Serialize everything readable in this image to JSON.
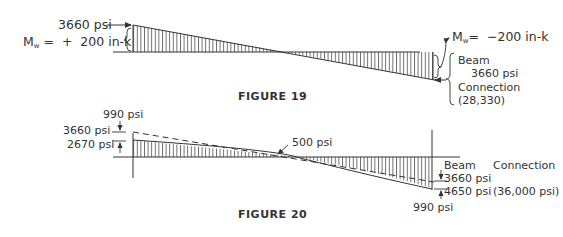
{
  "figure19": {
    "caption": "FIGURE 19",
    "left_stress": "3660 psi",
    "left_moment_symbol": "M",
    "left_moment_sub": "w",
    "left_moment_value": "=  +  200 in-k",
    "right_moment_symbol": "M",
    "right_moment_sub": "w",
    "right_moment_value": "=  −200 in-k",
    "right_beam_label": "Beam",
    "right_beam_stress": "3660 psi",
    "right_connection_label": "Connection",
    "right_connection_value": "(28,330)"
  },
  "figure20": {
    "caption": "FIGURE 20",
    "left_top_diff": "990 psi",
    "left_connection_stress": "3660 psi",
    "left_beam_stress": "2670 psi",
    "middle_label": "500 psi",
    "right_beam_header": "Beam",
    "right_connection_header": "Connection",
    "right_beam_stress": "3660 psi",
    "right_combined_stress": "4650 psi",
    "right_connection_stress": "(36,000 psi)",
    "right_bottom_diff": "990 psi"
  },
  "colors": {
    "ink": "#333333",
    "background": "#ffffff"
  }
}
